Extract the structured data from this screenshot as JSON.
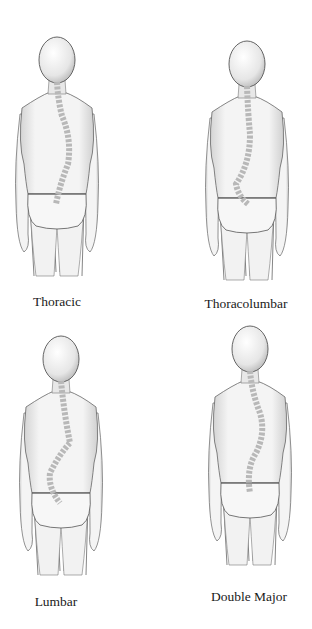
{
  "diagram": {
    "panels": [
      {
        "id": "thoracic",
        "label": "Thoracic",
        "curve": "thoracic"
      },
      {
        "id": "thoracolumbar",
        "label": "Thoracolumbar",
        "curve": "thoracolumbar"
      },
      {
        "id": "lumbar",
        "label": "Lumbar",
        "curve": "lumbar"
      },
      {
        "id": "double-major",
        "label": "Double Major",
        "curve": "double-major"
      }
    ],
    "colors": {
      "outline": "#555555",
      "shade": "#cfcfcf",
      "spine": "#bdbdbd",
      "background": "#ffffff"
    }
  }
}
